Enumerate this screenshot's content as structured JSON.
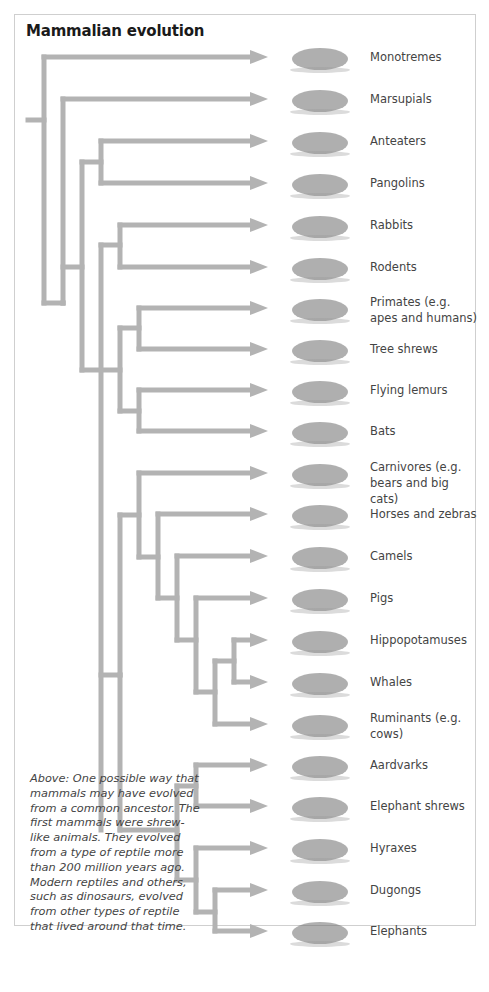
{
  "figure": {
    "title": "Mammalian evolution",
    "branch_color": "#b3b3b3",
    "leaves": [
      {
        "label": "Monotremes",
        "icon": "platypus-icon",
        "y": 57
      },
      {
        "label": "Marsupials",
        "icon": "sugar-glider-icon",
        "y": 99
      },
      {
        "label": "Anteaters",
        "icon": "anteater-icon",
        "y": 141
      },
      {
        "label": "Pangolins",
        "icon": "pangolin-icon",
        "y": 183
      },
      {
        "label": "Rabbits",
        "icon": "rabbit-icon",
        "y": 225
      },
      {
        "label": "Rodents",
        "icon": "rodent-icon",
        "y": 267
      },
      {
        "label": "Primates (e.g. apes and humans)",
        "icon": "chimpanzee-icon",
        "y": 308
      },
      {
        "label": "Tree shrews",
        "icon": "tree-shrew-icon",
        "y": 349
      },
      {
        "label": "Flying lemurs",
        "icon": "flying-lemur-icon",
        "y": 390
      },
      {
        "label": "Bats",
        "icon": "bat-icon",
        "y": 431
      },
      {
        "label": "Carnivores (e.g. bears and big cats)",
        "icon": "leopard-icon",
        "y": 473
      },
      {
        "label": "Horses and zebras",
        "icon": "horse-icon",
        "y": 514
      },
      {
        "label": "Camels",
        "icon": "camel-icon",
        "y": 556
      },
      {
        "label": "Pigs",
        "icon": "boar-icon",
        "y": 598
      },
      {
        "label": "Hippopotamuses",
        "icon": "hippo-icon",
        "y": 640
      },
      {
        "label": "Whales",
        "icon": "whale-icon",
        "y": 682
      },
      {
        "label": "Ruminants (e.g. cows)",
        "icon": "buffalo-icon",
        "y": 724
      },
      {
        "label": "Aardvarks",
        "icon": "aardvark-icon",
        "y": 765
      },
      {
        "label": "Elephant shrews",
        "icon": "elephant-shrew-icon",
        "y": 806
      },
      {
        "label": "Hyraxes",
        "icon": "hyrax-icon",
        "y": 848
      },
      {
        "label": "Dugongs",
        "icon": "dugong-icon",
        "y": 890
      },
      {
        "label": "Elephants",
        "icon": "elephant-icon",
        "y": 931
      }
    ],
    "caption": "Above: One possible way that mammals may have evolved from a common ancestor. The first mammals were shrew-like animals. They evolved from a type of reptile more than 200 million years ago. Modern reptiles and others, such as dinosaurs, evolved from other types of reptile that lived around that time."
  }
}
